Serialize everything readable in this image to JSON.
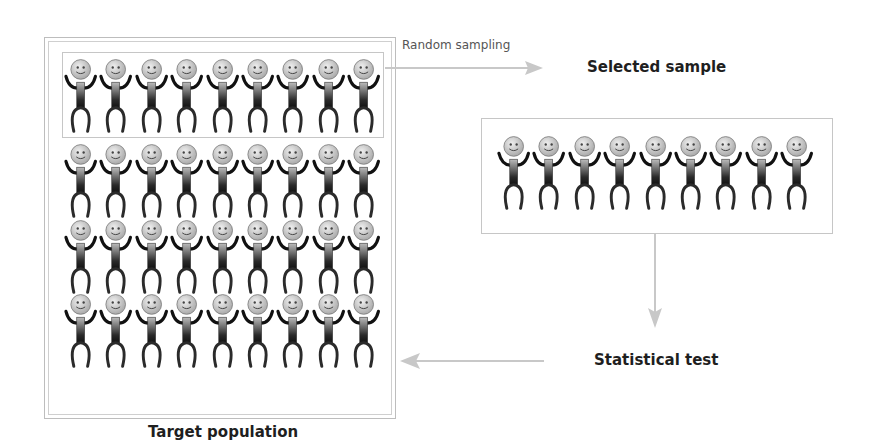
{
  "diagram": {
    "labels": {
      "random_sampling": "Random sampling",
      "selected_sample": "Selected sample",
      "statistical_test": "Statistical test",
      "target_population": "Target population"
    },
    "population": {
      "rows": 4,
      "per_row": 9,
      "highlighted_row": 1,
      "figure_icon": "smiley-stick-figure-icon"
    },
    "sample": {
      "count": 9,
      "figure_icon": "smiley-stick-figure-icon"
    },
    "flow": [
      {
        "from": "target-population",
        "to": "selected-sample",
        "label": "Random sampling",
        "direction": "right"
      },
      {
        "from": "selected-sample",
        "to": "statistical-test",
        "label": "",
        "direction": "down"
      },
      {
        "from": "statistical-test",
        "to": "target-population",
        "label": "",
        "direction": "left"
      }
    ],
    "colors": {
      "frame": "#c6c6c6",
      "arrow": "#c8c8c8",
      "text": "#1f1f1f",
      "figure_dark": "#1a1a1a",
      "figure_head": "#d9d9d9"
    }
  }
}
